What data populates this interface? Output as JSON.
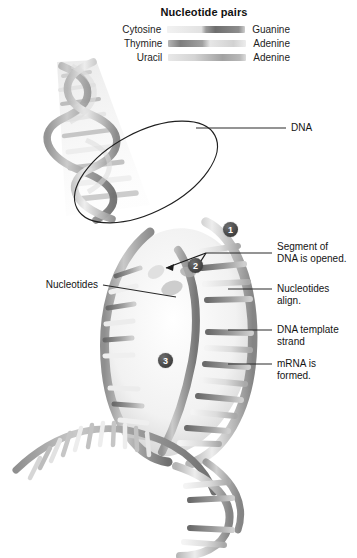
{
  "figure": {
    "title": "Nucleotide pairs"
  },
  "legend": {
    "title": "Nucleotide pairs",
    "rows": [
      {
        "left": "Cytosine",
        "right": "Guanine",
        "swatch": "cytosine-guanine-bar"
      },
      {
        "left": "Thymine",
        "right": "Adenine",
        "swatch": "thymine-adenine-bar"
      },
      {
        "left": "Uracil",
        "right": "Adenine",
        "swatch": "uracil-adenine-bar"
      }
    ]
  },
  "annotations": {
    "dna": "DNA",
    "nucleotides": "Nucleotides",
    "segment_opened": "Segment of\nDNA is opened.",
    "nucleotides_align": "Nucleotides\nalign.",
    "template_strand": "DNA template\nstrand",
    "mrna_formed": "mRNA is\nformed."
  },
  "steps": [
    {
      "number": "1"
    },
    {
      "number": "2"
    },
    {
      "number": "3"
    }
  ],
  "colors": {
    "ink": "#141414",
    "leader": "#2a2a2a",
    "badge": "#343434",
    "strand_dark": "#7c7c7c",
    "strand_light": "#e9e9e9",
    "background": "#ffffff"
  }
}
